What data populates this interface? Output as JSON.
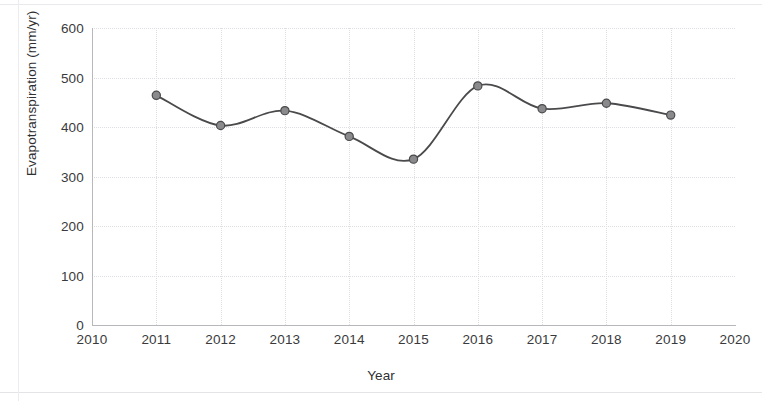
{
  "chart_data": {
    "type": "line",
    "title": "",
    "xlabel": "Year",
    "ylabel": "Evapotranspiration (mm/yr)",
    "xlim": [
      2010,
      2020
    ],
    "ylim": [
      0,
      600
    ],
    "grid": true,
    "legend": "none",
    "x_ticks": [
      "2010",
      "2011",
      "2012",
      "2013",
      "2014",
      "2015",
      "2016",
      "2017",
      "2018",
      "2019",
      "2020"
    ],
    "y_ticks": [
      "0",
      "100",
      "200",
      "300",
      "400",
      "500",
      "600"
    ],
    "x": [
      2011,
      2012,
      2013,
      2014,
      2015,
      2016,
      2017,
      2018,
      2019
    ],
    "categories": [
      "2011",
      "2012",
      "2013",
      "2014",
      "2015",
      "2016",
      "2017",
      "2018",
      "2019"
    ],
    "values": [
      464,
      403,
      433,
      381,
      335,
      483,
      437,
      448,
      424
    ],
    "series": [
      {
        "name": "Evapotranspiration",
        "values": [
          464,
          403,
          433,
          381,
          335,
          483,
          437,
          448,
          424
        ]
      }
    ],
    "line_color": "#4a4a4c",
    "marker_color": "#8a8a8d",
    "marker_edge_color": "#4a4a4c",
    "marker_shape": "circle",
    "grid_color": "#dedee2",
    "axis_color": "#b8b8bc",
    "background_color": "#ffffff"
  }
}
